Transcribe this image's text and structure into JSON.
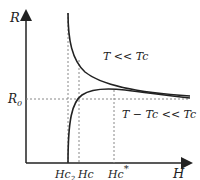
{
  "diagram": {
    "axes": {
      "y_label": "R",
      "x_label": "H"
    },
    "reference_line": {
      "label": "R",
      "label_subscript": "0"
    },
    "x_markers": [
      {
        "label": "Hc",
        "subscript": "2",
        "id": "hc2"
      },
      {
        "label": "Hc",
        "subscript": "",
        "id": "hc"
      },
      {
        "label": "Hc",
        "superscript": "*",
        "id": "hc-star"
      }
    ],
    "curves": [
      {
        "id": "upper",
        "label": "T << Tc",
        "description": "decreasing from divergence near Hc toward R0"
      },
      {
        "id": "lower",
        "label": "T − Tc << Tc",
        "description": "rising from zero at Hc2 to above R0 then approaching R0"
      }
    ],
    "colors": {
      "line": "#222222",
      "dashed": "#888888"
    }
  }
}
